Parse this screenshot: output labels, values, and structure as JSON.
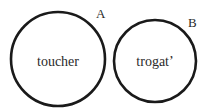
{
  "diagram": {
    "type": "venn-separate-circles",
    "circles": [
      {
        "id": "A",
        "label": "A",
        "text": "toucher",
        "cx": 58,
        "cy": 59,
        "r": 48
      },
      {
        "id": "B",
        "label": "B",
        "text": "trogat’",
        "cx": 155,
        "cy": 61,
        "r": 42
      }
    ],
    "stroke_color": "#1a1a1a"
  }
}
